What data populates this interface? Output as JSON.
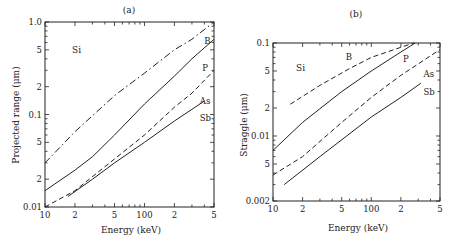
{
  "chart_data": [
    {
      "type": "line",
      "title": "(a)",
      "xlabel": "Energy (keV)",
      "ylabel": "Projected range (μm)",
      "xscale": "log",
      "yscale": "log",
      "xlim": [
        10,
        500
      ],
      "ylim": [
        0.01,
        1.0
      ],
      "grid": false,
      "material_label": "Si",
      "x_tick_labels": [
        {
          "value": 10,
          "label": "10"
        },
        {
          "value": 20,
          "label": "2"
        },
        {
          "value": 50,
          "label": "5"
        },
        {
          "value": 100,
          "label": "100"
        },
        {
          "value": 200,
          "label": "2"
        },
        {
          "value": 500,
          "label": "5"
        }
      ],
      "y_tick_labels": [
        {
          "value": 0.01,
          "label": "0.01"
        },
        {
          "value": 0.02,
          "label": "2"
        },
        {
          "value": 0.05,
          "label": "5"
        },
        {
          "value": 0.1,
          "label": "0.1"
        },
        {
          "value": 0.2,
          "label": "2"
        },
        {
          "value": 0.5,
          "label": "5"
        },
        {
          "value": 1.0,
          "label": "1.0"
        }
      ],
      "series": [
        {
          "name": "B",
          "style": "dash-dot",
          "x": [
            10,
            20,
            50,
            100,
            200,
            300,
            500
          ],
          "values": [
            0.03,
            0.065,
            0.16,
            0.28,
            0.5,
            0.65,
            1.0
          ],
          "label_pos": [
            400,
            0.62
          ]
        },
        {
          "name": "P",
          "style": "solid",
          "x": [
            10,
            20,
            30,
            50,
            100,
            200,
            300,
            500
          ],
          "values": [
            0.015,
            0.025,
            0.035,
            0.06,
            0.13,
            0.26,
            0.4,
            0.65
          ],
          "label_pos": [
            380,
            0.32
          ]
        },
        {
          "name": "As",
          "style": "dashed",
          "x": [
            10,
            20,
            50,
            100,
            200,
            300,
            500
          ],
          "values": [
            0.01,
            0.015,
            0.033,
            0.06,
            0.12,
            0.17,
            0.3
          ],
          "label_pos": [
            360,
            0.14
          ]
        },
        {
          "name": "Sb",
          "style": "solid",
          "x": [
            17,
            30,
            50,
            100,
            200,
            400
          ],
          "values": [
            0.013,
            0.02,
            0.03,
            0.05,
            0.085,
            0.14
          ],
          "label_pos": [
            360,
            0.092
          ]
        }
      ]
    },
    {
      "type": "line",
      "title": "(b)",
      "xlabel": "Energy (keV)",
      "ylabel": "Straggle (μm)",
      "xscale": "log",
      "yscale": "log",
      "xlim": [
        10,
        500
      ],
      "ylim": [
        0.002,
        0.1
      ],
      "grid": false,
      "material_label": "Si",
      "x_tick_labels": [
        {
          "value": 10,
          "label": "10"
        },
        {
          "value": 20,
          "label": "2"
        },
        {
          "value": 50,
          "label": "5"
        },
        {
          "value": 100,
          "label": "100"
        },
        {
          "value": 200,
          "label": "2"
        },
        {
          "value": 500,
          "label": "5"
        }
      ],
      "y_tick_labels": [
        {
          "value": 0.002,
          "label": "0.002"
        },
        {
          "value": 0.005,
          "label": "5"
        },
        {
          "value": 0.01,
          "label": "0.01"
        },
        {
          "value": 0.02,
          "label": "2"
        },
        {
          "value": 0.05,
          "label": "5"
        },
        {
          "value": 0.1,
          "label": "0.1"
        }
      ],
      "series": [
        {
          "name": "B",
          "style": "dashed",
          "x": [
            15,
            30,
            60,
            100,
            200,
            270
          ],
          "values": [
            0.022,
            0.035,
            0.053,
            0.07,
            0.09,
            0.1
          ],
          "label_pos": [
            55,
            0.07
          ]
        },
        {
          "name": "P",
          "style": "solid",
          "x": [
            10,
            20,
            50,
            100,
            200,
            280
          ],
          "values": [
            0.007,
            0.014,
            0.03,
            0.05,
            0.08,
            0.1
          ],
          "label_pos": [
            210,
            0.068
          ]
        },
        {
          "name": "As",
          "style": "dashed",
          "x": [
            10,
            20,
            50,
            100,
            200,
            500
          ],
          "values": [
            0.0038,
            0.006,
            0.014,
            0.026,
            0.045,
            0.085
          ],
          "label_pos": [
            340,
            0.046
          ]
        },
        {
          "name": "Sb",
          "style": "solid",
          "x": [
            13,
            30,
            100,
            200,
            320
          ],
          "values": [
            0.003,
            0.006,
            0.016,
            0.026,
            0.037
          ],
          "label_pos": [
            340,
            0.03
          ]
        }
      ]
    }
  ],
  "panels": {
    "a": {
      "title": "(a)",
      "xlabel": "Energy (keV)",
      "ylabel": "Projected range (μm)",
      "material": "Si"
    },
    "b": {
      "title": "(b)",
      "xlabel": "Energy (keV)",
      "ylabel": "Straggle (μm)",
      "material": "Si"
    }
  }
}
